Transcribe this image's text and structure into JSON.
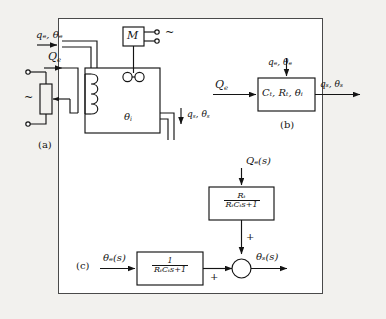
{
  "figure": {
    "caption_a": "(a)",
    "caption_b": "(b)",
    "caption_c": "(c)",
    "border_color": "#4a4a4a",
    "ink_color": "#141414",
    "background": "#ffffff",
    "page_background": "#f2f1ee"
  },
  "diagram_a": {
    "title_label": "(a)",
    "inlet_label": "qₑ, θₑ",
    "inlet_flow": "q",
    "inlet_flow_sub": "e",
    "inlet_temp": "θ",
    "inlet_temp_sub": "e",
    "heat_input": "Q",
    "heat_input_sub": "e",
    "motor_label": "M",
    "ac_source_symbol": "~",
    "ac_supply_left_symbol": "~",
    "tank_temp": "θ",
    "tank_temp_sub": "i",
    "outlet_flow": "q",
    "outlet_flow_sub": "s",
    "outlet_temp": "θ",
    "outlet_temp_sub": "s",
    "components": [
      "inlet-pipe",
      "rheostat",
      "heater-coil",
      "stirrer",
      "motor",
      "tank",
      "outlet-pipe"
    ]
  },
  "diagram_b": {
    "title_label": "(b)",
    "block_text_parts": [
      "C",
      "t",
      ", ",
      "R",
      "t",
      ", ",
      "θ",
      "i"
    ],
    "block_label": "Cₜ, Rₜ, θᵢ",
    "input_left": "Q",
    "input_left_sub": "e",
    "input_top": "qₑ, θₑ",
    "output_right": "qₛ, θₛ"
  },
  "diagram_c": {
    "title_label": "(c)",
    "input_top": "Qₑ(s)",
    "input_left": "θₑ(s)",
    "output": "θₛ(s)",
    "block_upper": {
      "numerator": "Rₜ",
      "denominator": "RₜCₜs+1"
    },
    "block_lower": {
      "numerator": "1",
      "denominator": "RₜCₜs+1"
    },
    "summing_sign_top": "+",
    "summing_sign_left": "+"
  }
}
